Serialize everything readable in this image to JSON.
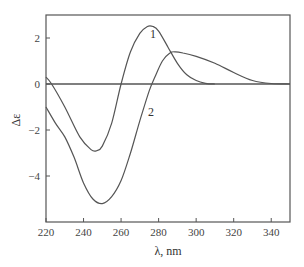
{
  "chart_data": {
    "type": "line",
    "title": "",
    "xlabel": "λ, nm",
    "ylabel": "Δε",
    "xlim": [
      220,
      350
    ],
    "ylim": [
      -6,
      3
    ],
    "xticks": [
      220,
      240,
      260,
      280,
      300,
      320,
      340
    ],
    "yticks": [
      -4,
      -2,
      0,
      2
    ],
    "grid": false,
    "legend": "inline curve labels",
    "zero_line": true,
    "series": [
      {
        "name": "1",
        "x": [
          220,
          223,
          230,
          238,
          244,
          247,
          250,
          255,
          260,
          265,
          270,
          274,
          277,
          280,
          285,
          290,
          295,
          300,
          305,
          310
        ],
        "y": [
          0.3,
          0.0,
          -1.0,
          -2.3,
          -2.85,
          -2.9,
          -2.7,
          -1.7,
          0.0,
          1.4,
          2.2,
          2.5,
          2.5,
          2.3,
          1.6,
          0.9,
          0.4,
          0.15,
          0.03,
          0.0
        ]
      },
      {
        "name": "2",
        "x": [
          220,
          225,
          230,
          235,
          240,
          245,
          250,
          255,
          260,
          265,
          270,
          275,
          278,
          282,
          286,
          289,
          293,
          300,
          310,
          320,
          330,
          340,
          350
        ],
        "y": [
          -1.0,
          -1.7,
          -2.3,
          -3.2,
          -4.3,
          -5.0,
          -5.2,
          -4.9,
          -4.2,
          -3.0,
          -1.6,
          -0.3,
          0.3,
          1.0,
          1.35,
          1.4,
          1.35,
          1.2,
          0.9,
          0.5,
          0.15,
          0.02,
          0.0
        ]
      }
    ],
    "annotations": [
      {
        "text": "1",
        "x": 277,
        "y": 2.0
      },
      {
        "text": "2",
        "x": 276,
        "y": -1.4
      }
    ]
  }
}
